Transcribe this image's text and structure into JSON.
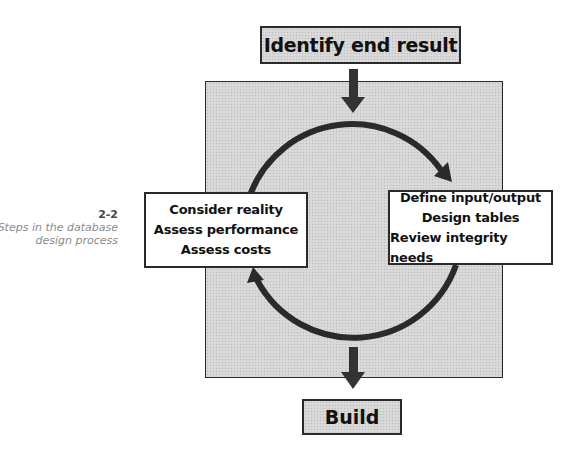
{
  "caption": {
    "number": "2-2",
    "lines": [
      "Steps in the database",
      "design process"
    ]
  },
  "diagram": {
    "start": "Identify end result",
    "left_box": [
      "Consider reality",
      "Assess performance",
      "Assess costs"
    ],
    "right_box": [
      "Define input/output",
      "Design tables",
      "Review integrity needs"
    ],
    "end": "Build",
    "flow": [
      "Identify end result -> cycle",
      "cycle: Define input/output, Design tables, Review integrity needs -> Consider reality, Assess performance, Assess costs -> (repeat)",
      "cycle -> Build"
    ],
    "colors": {
      "stroke": "#2a2a2a",
      "fill_gray": "#d6d6d6",
      "fill_white": "#ffffff"
    }
  }
}
